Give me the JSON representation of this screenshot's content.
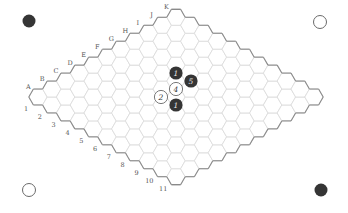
{
  "game": {
    "type": "Hex",
    "board_size": 11,
    "columns": [
      "A",
      "B",
      "C",
      "D",
      "E",
      "F",
      "G",
      "H",
      "I",
      "J",
      "K"
    ],
    "rows": [
      "1",
      "2",
      "3",
      "4",
      "5",
      "6",
      "7",
      "8",
      "9",
      "10",
      "11"
    ]
  },
  "colors": {
    "grid_line": "#dcdcdc",
    "edge_line": "#8a8a8a",
    "black_stone": "#353535",
    "white_stone_fill": "#ffffff",
    "white_stone_stroke": "#6a6a6a",
    "label": "#555555"
  },
  "corner_markers": [
    {
      "position": "top-left",
      "color": "black",
      "x": 29,
      "y": 21
    },
    {
      "position": "top-right",
      "color": "white",
      "x": 320,
      "y": 22
    },
    {
      "position": "bottom-left",
      "color": "white",
      "x": 29,
      "y": 190
    },
    {
      "position": "bottom-right",
      "color": "black",
      "x": 321,
      "y": 190
    }
  ],
  "stones": [
    {
      "color": "black",
      "label": "1",
      "x": 176,
      "y": 73
    },
    {
      "color": "black",
      "label": "5",
      "x": 191,
      "y": 81
    },
    {
      "color": "white",
      "label": "4",
      "x": 176,
      "y": 89
    },
    {
      "color": "white",
      "label": "2",
      "x": 161,
      "y": 97
    },
    {
      "color": "black",
      "label": "1",
      "x": 176,
      "y": 105
    }
  ]
}
